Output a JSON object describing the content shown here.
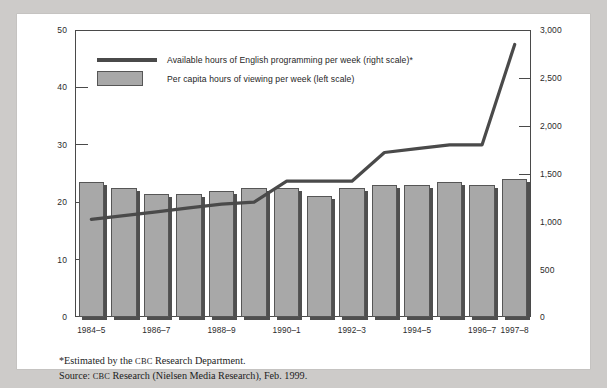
{
  "chart_data": {
    "type": "bar",
    "title": "",
    "subtitle": "",
    "xlabel": "",
    "ylabel": "",
    "grid": false,
    "legend_position": "top-left",
    "categories": [
      "1984–5",
      "1985–6",
      "1986–7",
      "1987–8",
      "1988–9",
      "1989–90",
      "1990–1",
      "1991–2",
      "1992–3",
      "1993–4",
      "1994–5",
      "1995–6",
      "1996–7",
      "1997–8"
    ],
    "visible_tick_labels": [
      "1984–5",
      "1986–7",
      "1988–9",
      "1990–1",
      "1992–3",
      "1994–5",
      "1996–7",
      "1997–8"
    ],
    "left_axis": {
      "label": "Per capita hours of viewing per week",
      "ylim": [
        0,
        50
      ],
      "ticks": [
        0,
        10,
        20,
        30,
        40,
        50
      ],
      "tick_labels": [
        "0",
        "10",
        "20",
        "30",
        "40",
        "50"
      ]
    },
    "right_axis": {
      "label": "Available hours of English programming per week",
      "ylim": [
        0,
        3000
      ],
      "ticks": [
        0,
        500,
        1000,
        1500,
        2000,
        2500,
        3000
      ],
      "tick_labels": [
        "0",
        "500",
        "1,000",
        "1,500",
        "2,000",
        "2,500",
        "3,000"
      ]
    },
    "series": [
      {
        "name": "Per capita hours of viewing per week (left scale)",
        "type": "bar",
        "axis": "left",
        "color": "#a8a8a8",
        "values": [
          23.5,
          22.5,
          21.5,
          21.5,
          22.0,
          22.5,
          22.5,
          21.0,
          22.5,
          23.0,
          23.0,
          23.5,
          23.0,
          24.0
        ]
      },
      {
        "name": "Available hours of English programming per week (right scale)*",
        "type": "line",
        "axis": "right",
        "color": "#4a4a4a",
        "values": [
          1020,
          1060,
          1100,
          1140,
          1180,
          1200,
          1420,
          1420,
          1420,
          1720,
          1760,
          1800,
          1800,
          2850
        ]
      }
    ]
  },
  "legend": {
    "line_entry": "Available hours of English programming per week (right scale)*",
    "bar_entry": "Per capita hours of viewing per week (left scale)"
  },
  "footnotes": {
    "estimated_prefix": "*Estimated by the ",
    "estimated_org": "CBC",
    "estimated_suffix": " Research Department.",
    "source_prefix": "Source: ",
    "source_org": "CBC",
    "source_suffix": " Research (Nielsen Media Research), Feb. 1999."
  }
}
